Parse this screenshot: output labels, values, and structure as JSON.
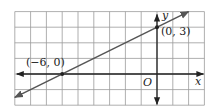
{
  "chart_data": {
    "type": "line",
    "title": "",
    "xlabel": "x",
    "ylabel": "y",
    "origin_label": "O",
    "xlim": [
      -9,
      3
    ],
    "ylim": [
      -2,
      4
    ],
    "grid": true,
    "series": [
      {
        "name": "line through (-6, 0) and (0, 3)",
        "x": [
          -9,
          -6,
          0,
          2
        ],
        "y": [
          -1.5,
          0,
          3,
          4
        ],
        "arrows": "both"
      }
    ],
    "points": [
      {
        "x": -6,
        "y": 0,
        "label": "(−6, 0)"
      },
      {
        "x": 0,
        "y": 3,
        "label": "(0, 3)"
      }
    ]
  },
  "colors": {
    "grid": "#9a9a9a",
    "axis": "#222222",
    "line": "#555555"
  }
}
